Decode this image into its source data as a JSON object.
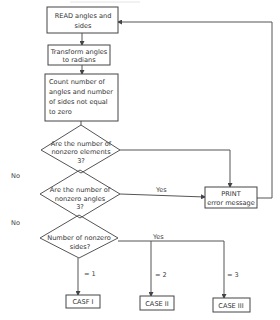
{
  "header_fragment": "",
  "nodes": {
    "read": {
      "lines": [
        "READ angles and",
        "sides"
      ]
    },
    "transform": {
      "lines": [
        "Transform angles",
        "to radians"
      ]
    },
    "count": {
      "lines": [
        "Count number of",
        "angles and number",
        "of sides not equal",
        "to zero"
      ]
    },
    "decision_elements": {
      "lines": [
        "Are the number of",
        "nonzero elements",
        "3?"
      ]
    },
    "decision_angles": {
      "lines": [
        "Are the number of",
        "nonzero angles",
        "3?"
      ]
    },
    "decision_sides": {
      "lines": [
        "Number of nonzero",
        "sides?"
      ]
    },
    "print": {
      "lines": [
        "PRINT",
        "error message"
      ]
    },
    "case1": {
      "label": "CASF I"
    },
    "case2": {
      "label": "CASE II"
    },
    "case3": {
      "label": "CASE III"
    }
  },
  "edge_labels": {
    "no_elements": "No",
    "no_angles": "No",
    "yes_angles": "Yes",
    "yes_sides": "Yes",
    "eq1": "= 1",
    "eq2": "= 2",
    "eq3": "= 3"
  }
}
